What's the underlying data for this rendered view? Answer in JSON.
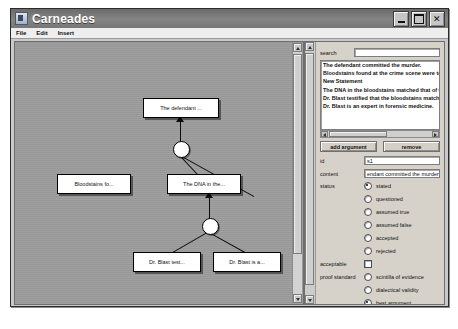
{
  "window": {
    "title": "Carneades",
    "icon": "app-icon",
    "buttons": {
      "minimize": "_",
      "maximize": "□",
      "close": "✕"
    }
  },
  "menubar": {
    "items": [
      "File",
      "Edit",
      "Insert"
    ]
  },
  "graph": {
    "statements": [
      {
        "id": "n1",
        "label": "The defendant ...",
        "x": 128,
        "y": 56,
        "w": 74,
        "h": 18
      },
      {
        "id": "n2",
        "label": "Bloodstains fo...",
        "x": 42,
        "y": 132,
        "w": 72,
        "h": 18
      },
      {
        "id": "n3",
        "label": "The DNA in the...",
        "x": 152,
        "y": 132,
        "w": 72,
        "h": 18
      },
      {
        "id": "n4",
        "label": "Dr. Blast test...",
        "x": 118,
        "y": 210,
        "w": 66,
        "h": 18
      },
      {
        "id": "n5",
        "label": "Dr. Blast is a...",
        "x": 198,
        "y": 210,
        "w": 66,
        "h": 18
      }
    ],
    "argument_nodes": [
      {
        "id": "a1",
        "cx": 165,
        "cy": 106
      },
      {
        "id": "a2",
        "cx": 194,
        "cy": 183
      }
    ]
  },
  "panel": {
    "search": {
      "label": "search",
      "value": "",
      "placeholder": ""
    },
    "statement_list": [
      "The defendant committed the murder.",
      "Bloodstains found at the crime scene were tested",
      "New Statement",
      "The DNA in the bloodstains matched that of the de",
      "Dr. Blast testified that the bloodstains matched.",
      "Dr. Blast is an expert in forensic medicine."
    ],
    "buttons": {
      "add": "add argument",
      "remove": "remove"
    },
    "fields": {
      "id": {
        "label": "id",
        "value": "s1"
      },
      "content": {
        "label": "content",
        "value": "endant committed the murder"
      },
      "status": {
        "label": "status",
        "options": [
          "stated",
          "questioned",
          "assumed true",
          "assumed false",
          "accepted",
          "rejected"
        ],
        "selected": "stated"
      },
      "acceptable": {
        "label": "acceptable",
        "checked": false
      },
      "proof_standard": {
        "label": "proof standard",
        "options": [
          "scintilla of evidence",
          "dialectical validity",
          "best argument"
        ],
        "selected": "best argument",
        "checkboxes": [
          {
            "label": "negated",
            "checked": false
          },
          {
            "label": "complement",
            "checked": false
          }
        ]
      }
    }
  },
  "colors": {
    "titlebar": "#7b7b7b",
    "window_bg": "#c9c9c9",
    "canvas_bg": "#9d9d9d",
    "panel_bg": "#d6d2ca",
    "node_fill": "#ffffff",
    "node_border": "#000000"
  }
}
